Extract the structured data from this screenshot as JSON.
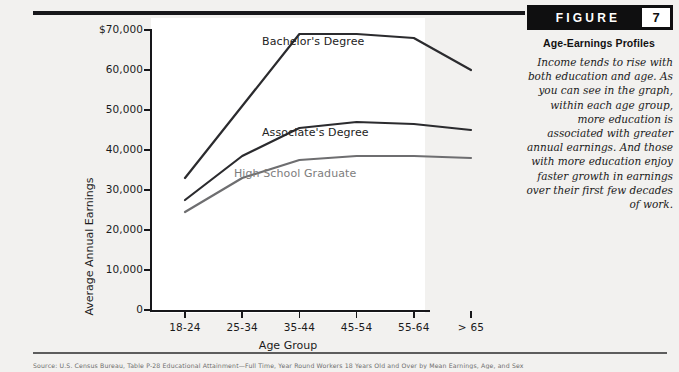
{
  "figure": {
    "badge_word": "FIGURE",
    "badge_number": "7",
    "title": "Age-Earnings Profiles",
    "body": "Income tends to rise with both education and age. As you can see in the graph, within each age group, more education is associated with greater annual earnings. And those with more education enjoy faster growth in earnings over their first few decades of work."
  },
  "source_note": "Source: U.S. Census Bureau, Table P-28 Educational Attainment—Full Time, Year Round Workers 18 Years Old and Over by Mean Earnings, Age, and Sex",
  "chart_data": {
    "type": "line",
    "title": "Age-Earnings Profiles",
    "xlabel": "Age Group",
    "ylabel": "Average Annual Earnings",
    "categories": [
      "18-24",
      "25-34",
      "35-44",
      "45-54",
      "55-64",
      "> 65"
    ],
    "ylim": [
      0,
      70000
    ],
    "yticks": [
      0,
      10000,
      20000,
      30000,
      40000,
      50000,
      60000,
      70000
    ],
    "ytick_labels": [
      "0",
      "10,000",
      "20,000",
      "30,000",
      "40,000",
      "50,000",
      "60,000",
      "$70,000"
    ],
    "grid": false,
    "legend": "inline-labels",
    "series": [
      {
        "name": "Bachelor's Degree",
        "color": "#2b2b2e",
        "values": [
          33000,
          51000,
          69000,
          69000,
          68000,
          60000
        ]
      },
      {
        "name": "Associate's Degree",
        "color": "#2b2b2e",
        "values": [
          27500,
          38500,
          45500,
          47000,
          46500,
          45000
        ]
      },
      {
        "name": "High School Graduate",
        "color": "#6e6e70",
        "values": [
          24500,
          33000,
          37500,
          38500,
          38500,
          38000
        ]
      }
    ]
  }
}
